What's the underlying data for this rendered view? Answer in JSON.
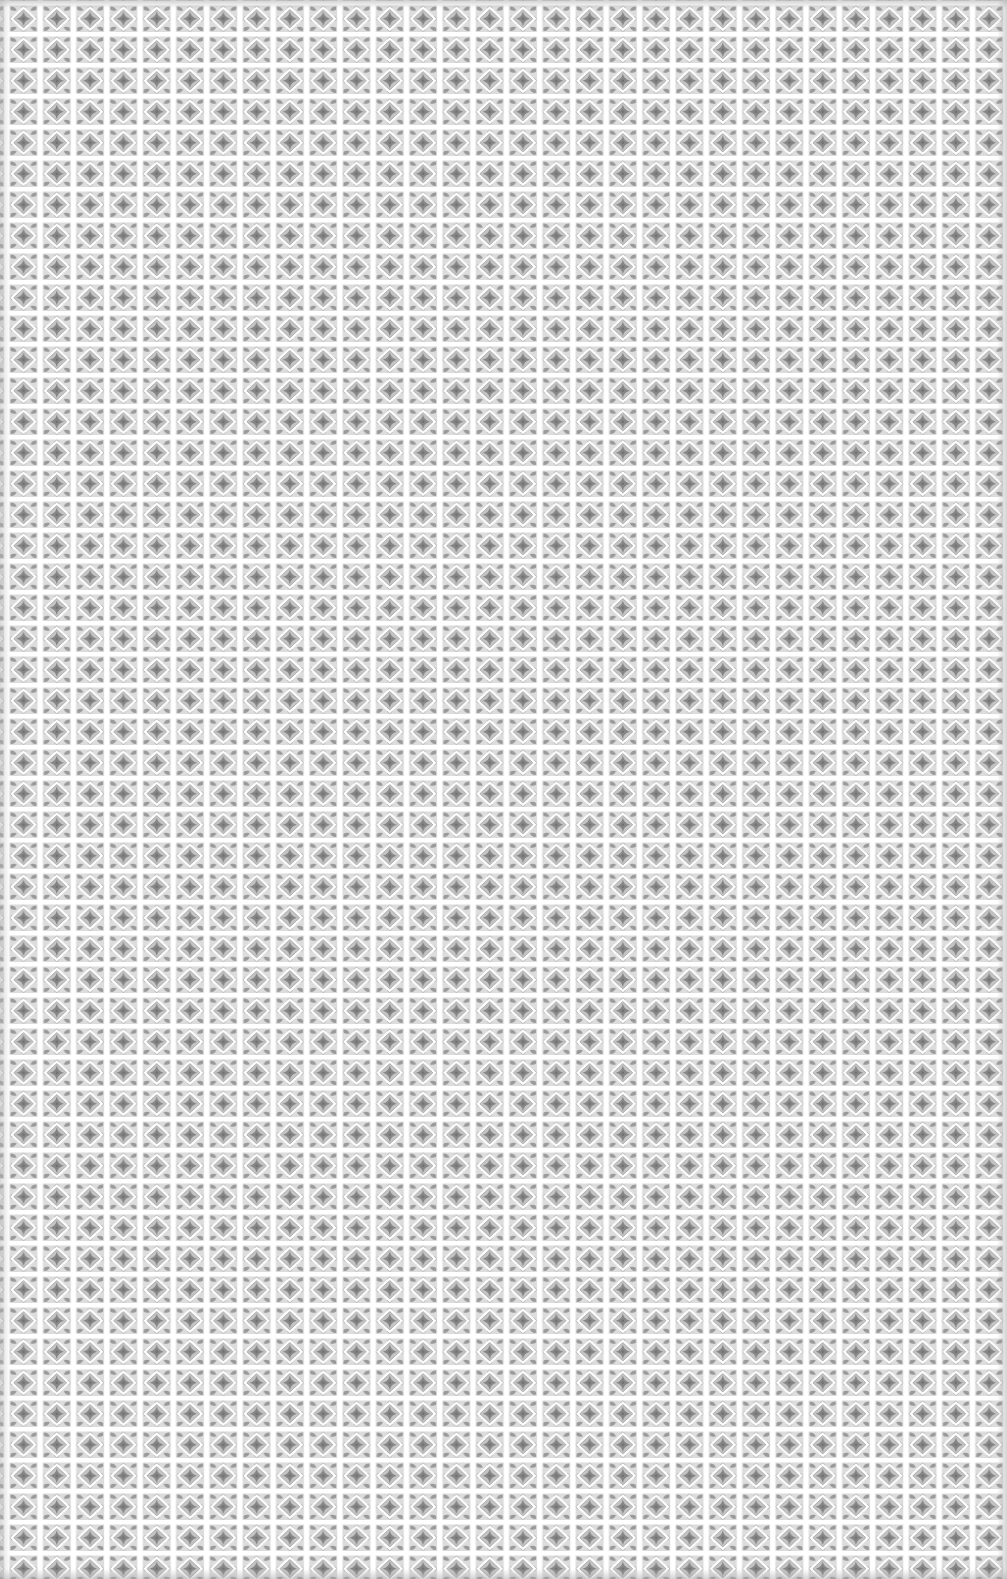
{
  "image": {
    "description": "Seamless repeating ornamental tile pattern in grey on white",
    "width": 1007,
    "height": 1579
  },
  "pattern": {
    "tile_width": 33.3,
    "tile_height": 31,
    "columns": 30,
    "rows": 51,
    "motif": "four-point star inside diamond outline with corner leaf blobs",
    "colors": {
      "background": "#fafafa",
      "grid_gap": "#ffffff",
      "motif_dark": "#8a8a8a",
      "motif_mid": "#a8a8a8",
      "motif_light": "#d2d2d2"
    }
  }
}
